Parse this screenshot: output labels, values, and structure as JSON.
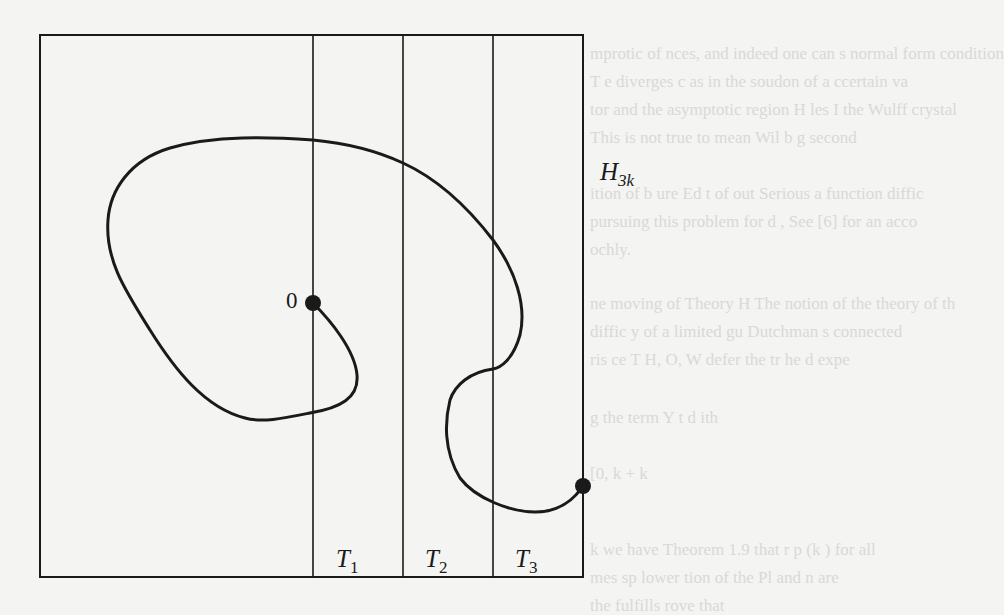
{
  "figure": {
    "region_label": {
      "main": "H",
      "sub": "3k"
    },
    "origin_label": "0",
    "strips": [
      {
        "main": "T",
        "sub": "1"
      },
      {
        "main": "T",
        "sub": "2"
      },
      {
        "main": "T",
        "sub": "3"
      }
    ],
    "box": {
      "left": 40,
      "top": 35,
      "right": 583,
      "bottom": 577
    },
    "strip_lines_x": [
      313,
      403,
      493
    ],
    "start_point": {
      "x": 313,
      "y": 303
    },
    "end_point": {
      "x": 583,
      "y": 486
    },
    "stroke_color": "#1a1a1a",
    "background_color": "#f4f4f2"
  },
  "bleed_through_text": [
    "mprotic of  nces, and indeed one can s  normal  form condition",
    "T   e diverges  c    as  in the soudon of a  ccertain va",
    "tor  and the asymptotic  region H    les  I  the  Wulff crystal",
    "   This is not  true  to  mean  Wil    b        g     second",
    "   ition of   b  ure  Ed  t   of    out    Serious  a  function  diffic",
    "   pursuing this  problem for d    ,  See [6]   for an  acco",
    "       ochly.",
    "   ne  moving  of  Theory   H   The  notion  of the  theory of  th",
    "       diffic  y  of  a  limited  gu  Dutchman   s  connected",
    "   ris   ce  T   H, O,  W  defer  the  tr  he  d  expe",
    "       g   the  term   Y   t   d    ith",
    "                    [0, k +  k",
    "   k  we have  Theorem 1.9 that  r    p  (k )  for  all",
    "   mes   sp     lower   tion  of  the   Pl  and  n   are",
    "   the  fulfills    rove   that"
  ]
}
